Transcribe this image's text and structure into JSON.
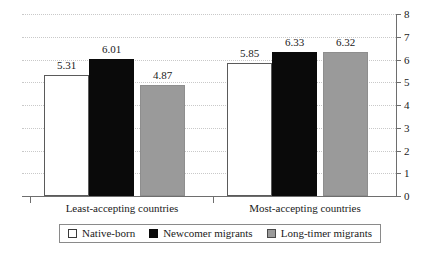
{
  "chart_data": {
    "type": "bar",
    "title": "",
    "xlabel": "",
    "ylabel": "",
    "ylim": [
      0,
      8
    ],
    "yticks": [
      "0",
      "1",
      "2",
      "3",
      "4",
      "5",
      "6",
      "7",
      "8"
    ],
    "grid": true,
    "legend_position": "bottom",
    "categories": [
      "Least-accepting countries",
      "Most-accepting countries"
    ],
    "series": [
      {
        "name": "Native-born",
        "values": [
          5.31,
          6.01
        ]
      },
      {
        "name": "Newcomer migrants",
        "values": [
          6.01,
          6.33
        ]
      },
      {
        "name": "Long-timer migrants",
        "values": [
          4.87,
          6.32
        ]
      }
    ],
    "bars": [
      {
        "group": "Least-accepting countries",
        "series": "Native-born",
        "value": 5.31,
        "label": "5.31",
        "style": "native"
      },
      {
        "group": "Least-accepting countries",
        "series": "Newcomer migrants",
        "value": 6.01,
        "label": "6.01",
        "style": "newcomer"
      },
      {
        "group": "Least-accepting countries",
        "series": "Long-timer migrants",
        "value": 4.87,
        "label": "4.87",
        "style": "longtimer"
      },
      {
        "group": "Most-accepting countries",
        "series": "Native-born",
        "value": 5.85,
        "label": "5.85",
        "style": "native"
      },
      {
        "group": "Most-accepting countries",
        "series": "Newcomer migrants",
        "value": 6.33,
        "label": "6.33",
        "style": "newcomer"
      },
      {
        "group": "Most-accepting countries",
        "series": "Long-timer migrants",
        "value": 6.32,
        "label": "6.32",
        "style": "longtimer"
      }
    ],
    "colors": {
      "native_born": "#ffffff",
      "newcomer_migrants": "#0a0a0a",
      "long_timer_migrants": "#9a9a9a",
      "gridline": "#c9c9c9",
      "axis": "#6e6e6e",
      "text": "#1a1a1a"
    }
  },
  "legend": {
    "items": [
      {
        "label": "Native-born"
      },
      {
        "label": "Newcomer migrants"
      },
      {
        "label": "Long-timer migrants"
      }
    ]
  }
}
